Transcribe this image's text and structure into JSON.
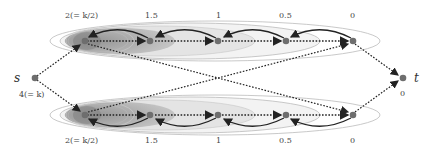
{
  "diagram": {
    "source": {
      "label": "s",
      "value": "4(= k)"
    },
    "sink": {
      "label": "t",
      "value": "0"
    },
    "top_row": {
      "labels": [
        "2(= k/2)",
        "1.5",
        "1",
        "0.5",
        "0"
      ]
    },
    "bottom_row": {
      "labels": [
        "2(= k/2)",
        "1.5",
        "1",
        "0.5",
        "0"
      ]
    },
    "colors": {
      "node": "#6e6e6e",
      "edge": "#222222",
      "ellipse_dark": "#8a8a8a",
      "ellipse_light": "#e6e6e6"
    }
  }
}
